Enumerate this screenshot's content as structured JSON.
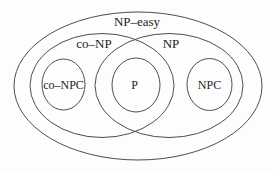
{
  "diagram": {
    "kind": "euler-diagram-complexity-classes",
    "background_color": "#fdfdfd",
    "line_color": "#4d4d4d",
    "text_color": "#1c1c1c",
    "sets": {
      "np_easy": {
        "label": "NP–easy"
      },
      "co_np": {
        "label": "co–NP"
      },
      "np": {
        "label": "NP"
      },
      "co_npc": {
        "label": "co–NPC"
      },
      "p": {
        "label": "P"
      },
      "npc": {
        "label": "NPC"
      }
    }
  }
}
